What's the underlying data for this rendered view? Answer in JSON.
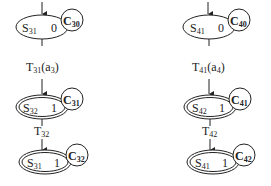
{
  "diagram": {
    "columns": [
      {
        "id": "left",
        "states": [
          {
            "label": "S",
            "sub": "31",
            "value": "0",
            "final": false,
            "circle": {
              "label": "C",
              "sub": "30"
            }
          },
          {
            "label": "S",
            "sub": "32",
            "value": "1",
            "final": true,
            "circle": {
              "label": "C",
              "sub": "31"
            }
          },
          {
            "label": "S",
            "sub": "31",
            "value": "1",
            "final": true,
            "circle": {
              "label": "C",
              "sub": "32"
            }
          }
        ],
        "transitions": [
          {
            "label": "T",
            "sub": "31",
            "arg": "(a",
            "arg_sub": "3",
            "arg_end": ")"
          },
          {
            "label": "T",
            "sub": "32",
            "arg": "",
            "arg_sub": "",
            "arg_end": ""
          }
        ]
      },
      {
        "id": "right",
        "states": [
          {
            "label": "S",
            "sub": "41",
            "value": "0",
            "final": false,
            "circle": {
              "label": "C",
              "sub": "40"
            }
          },
          {
            "label": "S",
            "sub": "42",
            "value": "1",
            "final": true,
            "circle": {
              "label": "C",
              "sub": "41"
            }
          },
          {
            "label": "S",
            "sub": "41",
            "value": "1",
            "final": true,
            "circle": {
              "label": "C",
              "sub": "42"
            }
          }
        ],
        "transitions": [
          {
            "label": "T",
            "sub": "41",
            "arg": "(a",
            "arg_sub": "4",
            "arg_end": ")"
          },
          {
            "label": "T",
            "sub": "42",
            "arg": "",
            "arg_sub": "",
            "arg_end": ""
          }
        ]
      }
    ]
  }
}
